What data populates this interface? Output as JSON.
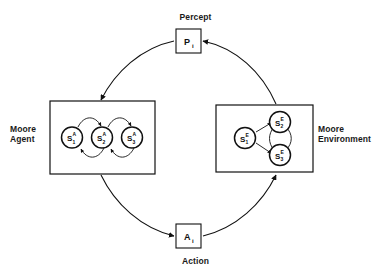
{
  "diagram": {
    "stroke_color": "#111111",
    "background_color": "#ffffff",
    "labels": {
      "percept": "Percept",
      "action": "Action",
      "agent": "Moore\nAgent",
      "environment": "Moore\nEnvironment"
    },
    "io_nodes": [
      {
        "id": "percept-box",
        "base": "P",
        "subscript": "i"
      },
      {
        "id": "action-box",
        "base": "A",
        "subscript": "i"
      }
    ],
    "agent_box": {
      "name": "Moore Agent",
      "states": [
        {
          "base": "S",
          "superscript": "A",
          "subscript": "1"
        },
        {
          "base": "S",
          "superscript": "A",
          "subscript": "2"
        },
        {
          "base": "S",
          "superscript": "A",
          "subscript": "3"
        }
      ],
      "transitions": [
        {
          "from": "S1A",
          "to": "S2A"
        },
        {
          "from": "S2A",
          "to": "S3A"
        },
        {
          "from": "S2A",
          "to": "S1A"
        },
        {
          "from": "S3A",
          "to": "S2A"
        }
      ]
    },
    "environment_box": {
      "name": "Moore Environment",
      "states": [
        {
          "base": "S",
          "superscript": "E",
          "subscript": "1"
        },
        {
          "base": "S",
          "superscript": "E",
          "subscript": "2"
        },
        {
          "base": "S",
          "superscript": "E",
          "subscript": "3"
        }
      ],
      "transitions": [
        {
          "from": "S1E",
          "to": "S2E"
        },
        {
          "from": "S1E",
          "to": "S3E"
        },
        {
          "from": "S2E",
          "to": "S3E"
        },
        {
          "from": "S3E",
          "to": "S2E"
        }
      ]
    },
    "loop_arrows": [
      {
        "from": "Moore Environment",
        "to": "Percept"
      },
      {
        "from": "Percept",
        "to": "Moore Agent"
      },
      {
        "from": "Moore Agent",
        "to": "Action"
      },
      {
        "from": "Action",
        "to": "Moore Environment"
      }
    ]
  }
}
